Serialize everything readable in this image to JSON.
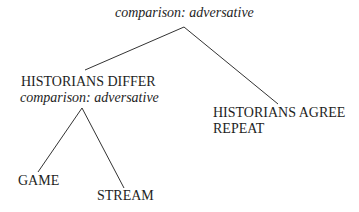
{
  "diagram": {
    "type": "tree",
    "root": {
      "label": "comparison: adversative"
    },
    "left_node": {
      "title": "HISTORIANS DIFFER",
      "relation": "comparison: adversative"
    },
    "right_node": {
      "title": "HISTORIANS AGREE",
      "subtitle": "REPEAT"
    },
    "leaves": [
      {
        "label": "GAME"
      },
      {
        "label": "STREAM"
      }
    ],
    "edges": [
      {
        "from": "root",
        "to": "HISTORIANS DIFFER"
      },
      {
        "from": "root",
        "to": "HISTORIANS AGREE"
      },
      {
        "from": "HISTORIANS DIFFER",
        "to": "GAME"
      },
      {
        "from": "HISTORIANS DIFFER",
        "to": "STREAM"
      }
    ],
    "colors": {
      "line": "#333333",
      "text": "#1e1e1e",
      "background": "#ffffff"
    }
  }
}
